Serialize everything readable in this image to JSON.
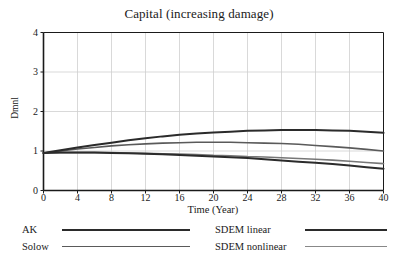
{
  "chart_data": {
    "type": "line",
    "title": "Capital (increasing damage)",
    "xlabel": "Time (Year)",
    "ylabel": "Dmnl",
    "xlim": [
      0,
      40
    ],
    "ylim": [
      0,
      4
    ],
    "xticks": [
      0,
      4,
      8,
      12,
      16,
      20,
      24,
      28,
      32,
      36,
      40
    ],
    "yticks": [
      0,
      1,
      2,
      3,
      4
    ],
    "grid": true,
    "legend_position": "below",
    "x": [
      0,
      2,
      4,
      6,
      8,
      10,
      12,
      14,
      16,
      18,
      20,
      22,
      24,
      26,
      28,
      30,
      32,
      34,
      36,
      38,
      40
    ],
    "series": [
      {
        "name": "AK",
        "color": "#2b2b2b",
        "width": 2.0,
        "values": [
          0.95,
          1.02,
          1.09,
          1.15,
          1.21,
          1.27,
          1.32,
          1.37,
          1.41,
          1.44,
          1.47,
          1.49,
          1.51,
          1.52,
          1.53,
          1.53,
          1.53,
          1.52,
          1.51,
          1.49,
          1.46
        ]
      },
      {
        "name": "Solow",
        "color": "#5a5a5a",
        "width": 1.6,
        "values": [
          0.95,
          1.0,
          1.05,
          1.09,
          1.13,
          1.16,
          1.18,
          1.2,
          1.21,
          1.22,
          1.22,
          1.22,
          1.21,
          1.2,
          1.19,
          1.17,
          1.14,
          1.11,
          1.08,
          1.04,
          1.0
        ]
      },
      {
        "name": "SDEM linear",
        "color": "#2b2b2b",
        "width": 2.0,
        "values": [
          0.95,
          0.96,
          0.96,
          0.96,
          0.95,
          0.94,
          0.93,
          0.92,
          0.9,
          0.88,
          0.86,
          0.84,
          0.82,
          0.79,
          0.76,
          0.73,
          0.7,
          0.67,
          0.63,
          0.59,
          0.55
        ]
      },
      {
        "name": "SDEM nonlinear",
        "color": "#777777",
        "width": 1.6,
        "values": [
          0.95,
          0.96,
          0.96,
          0.96,
          0.96,
          0.95,
          0.94,
          0.93,
          0.92,
          0.91,
          0.89,
          0.88,
          0.86,
          0.85,
          0.83,
          0.81,
          0.79,
          0.77,
          0.74,
          0.71,
          0.68
        ]
      }
    ]
  },
  "legend": {
    "items": [
      {
        "label": "AK",
        "color": "#2b2b2b",
        "width": 2.0
      },
      {
        "label": "Solow",
        "color": "#5a5a5a",
        "width": 1.6
      },
      {
        "label": "SDEM linear",
        "color": "#2b2b2b",
        "width": 2.0
      },
      {
        "label": "SDEM nonlinear",
        "color": "#888888",
        "width": 1.6
      }
    ]
  },
  "style": {
    "axis_color": "#1a1a1a",
    "grid_color": "#cfcfcf",
    "background": "#ffffff"
  }
}
